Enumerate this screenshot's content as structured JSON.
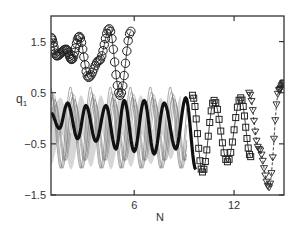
{
  "chart_data": {
    "type": "line",
    "title": "",
    "xlabel": "N",
    "ylabel": "q",
    "ylabel_subscript": "1",
    "xlim": [
      1,
      15
    ],
    "ylim": [
      -1.5,
      2.0
    ],
    "xticks": [
      6,
      12
    ],
    "xtick_labels": [
      "6",
      "12"
    ],
    "yticks": [
      -1.5,
      -0.5,
      0.5,
      1.5
    ],
    "ytick_labels": [
      "−1.5",
      "−0.5",
      "0.5",
      "1.5"
    ],
    "grid": false,
    "legend": null,
    "series": [
      {
        "name": "circles",
        "marker": "circle",
        "color": "#222222",
        "x": [
          1.0,
          1.35,
          1.9,
          2.25,
          2.7,
          3.25,
          3.9,
          4.5,
          5.15,
          5.8
        ],
        "y": [
          1.58,
          1.22,
          1.35,
          1.15,
          1.6,
          0.8,
          1.13,
          1.75,
          0.45,
          1.7
        ]
      },
      {
        "name": "dense band (upper envelope)",
        "marker": "none",
        "color": "#9a9a9a",
        "x": [
          1.0,
          1.6,
          2.2,
          2.8,
          3.4,
          4.0,
          4.6,
          5.2,
          5.8,
          6.4,
          7.0,
          7.6,
          8.2,
          8.8
        ],
        "y": [
          0.2,
          0.4,
          -0.3,
          0.45,
          -0.2,
          0.45,
          -0.25,
          0.5,
          -0.2,
          0.45,
          -0.25,
          0.4,
          -0.35,
          0.45
        ]
      },
      {
        "name": "dense band (lower envelope)",
        "marker": "none",
        "color": "#9a9a9a",
        "x": [
          1.0,
          1.6,
          2.2,
          2.8,
          3.4,
          4.0,
          4.6,
          5.2,
          5.8,
          6.4,
          7.0,
          7.6,
          8.2,
          8.8
        ],
        "y": [
          -0.9,
          -0.3,
          -1.0,
          -0.3,
          -0.95,
          -0.25,
          -1.0,
          -0.3,
          -0.95,
          -0.3,
          -0.9,
          -0.3,
          -0.8,
          -0.2
        ]
      },
      {
        "name": "main curve (dark)",
        "marker": "none",
        "color": "#111111",
        "x": [
          1.0,
          1.5,
          2.0,
          2.6,
          3.1,
          3.7,
          4.3,
          4.9,
          5.4,
          6.0,
          6.6,
          7.2,
          7.8,
          8.5,
          9.1,
          9.7
        ],
        "y": [
          0.1,
          -0.2,
          0.3,
          -0.4,
          0.25,
          -0.45,
          0.25,
          -0.6,
          0.35,
          -0.65,
          0.35,
          -0.7,
          0.3,
          -0.6,
          0.4,
          -1.0
        ]
      },
      {
        "name": "squares",
        "marker": "square",
        "color": "#222222",
        "x": [
          9.5,
          10.1,
          10.8,
          11.6,
          12.4,
          13.0
        ],
        "y": [
          0.45,
          -1.05,
          0.35,
          -0.85,
          0.4,
          -0.75
        ]
      },
      {
        "name": "triangles",
        "marker": "triangle-down",
        "color": "#222222",
        "x": [
          12.9,
          13.5,
          14.1,
          14.7,
          15.0
        ],
        "y": [
          0.5,
          -0.6,
          -1.35,
          0.55,
          0.7
        ]
      }
    ]
  }
}
